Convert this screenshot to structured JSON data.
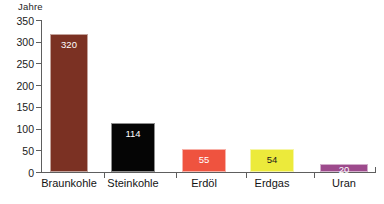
{
  "chart_data": {
    "type": "bar",
    "title": "",
    "ylabel": "Jahre",
    "xlabel": "",
    "ylim": [
      0,
      350
    ],
    "yticks": [
      0,
      50,
      100,
      150,
      200,
      250,
      300,
      350
    ],
    "ytick_labels": [
      "0",
      "50",
      "100",
      "150",
      "200",
      "250",
      "300",
      "350"
    ],
    "grid": false,
    "legend": "none",
    "categories": [
      "Braunkohle",
      "Steinkohle",
      "Erdöl",
      "Erdgas",
      "Uran"
    ],
    "values": [
      320,
      114,
      55,
      54,
      20
    ],
    "value_labels": [
      "320",
      "114",
      "55",
      "54",
      "20"
    ],
    "bar_colors": [
      "#7b3123",
      "#050505",
      "#ef533f",
      "#ecea3b",
      "#9d4a8c"
    ],
    "value_label_colors": [
      "#ffffff",
      "#ffffff",
      "#ffffff",
      "#1a1a1a",
      "#ffffff"
    ],
    "bars": [
      {
        "label": "Braunkohle",
        "value": 320,
        "value_label": "320",
        "color": "#7b3123",
        "value_color": "#ffffff",
        "left": 50,
        "width": 38
      },
      {
        "label": "Steinkohle",
        "value": 114,
        "value_label": "114",
        "color": "#050505",
        "value_color": "#ffffff",
        "left": 111,
        "width": 44
      },
      {
        "label": "Erdöl",
        "value": 55,
        "value_label": "55",
        "color": "#ef533f",
        "value_color": "#ffffff",
        "left": 182,
        "width": 44
      },
      {
        "label": "Erdgas",
        "value": 54,
        "value_label": "54",
        "color": "#ecea3b",
        "value_color": "#1a1a1a",
        "left": 250,
        "width": 44
      },
      {
        "label": "Uran",
        "value": 20,
        "value_label": "20",
        "color": "#9d4a8c",
        "value_color": "#ffffff",
        "left": 320,
        "width": 48
      }
    ],
    "category_tick_positions": [
      104,
      176,
      246,
      314
    ],
    "category_label_centers": [
      69,
      133,
      204,
      272,
      344
    ]
  }
}
